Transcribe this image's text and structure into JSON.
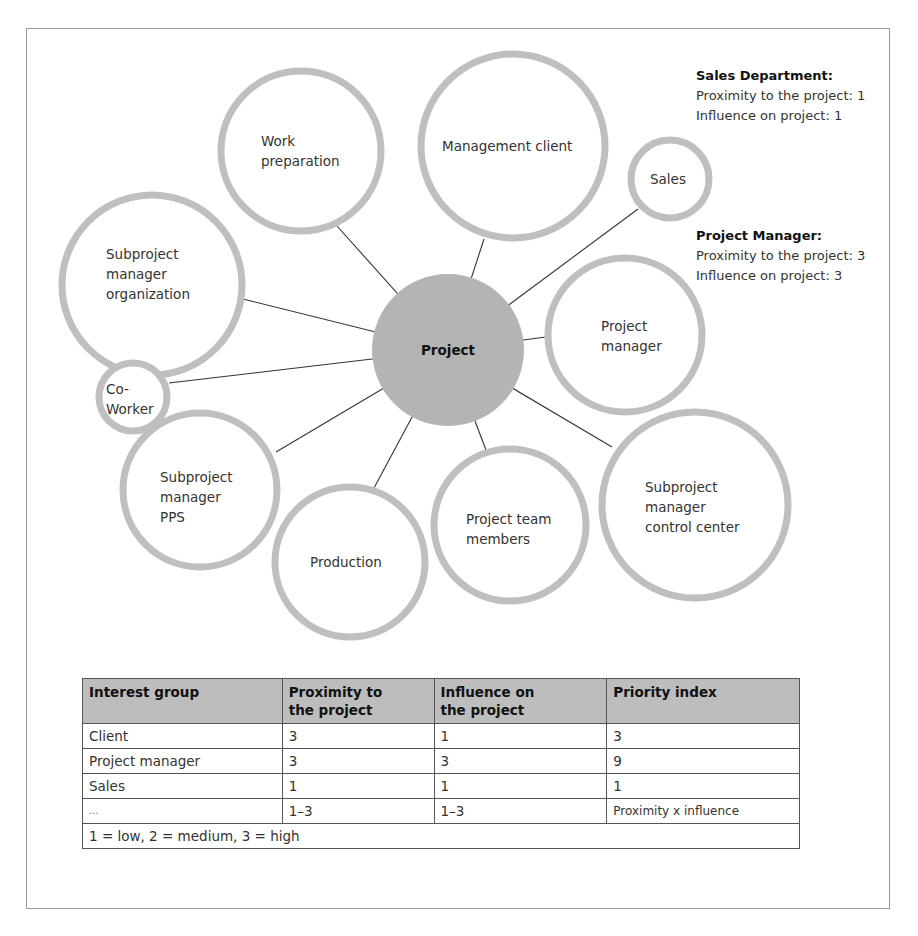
{
  "diagram": {
    "center": {
      "label": "Project",
      "fill": "#b4b4b4"
    },
    "nodes": [
      {
        "id": "work-preparation",
        "label": "Work preparation",
        "lines": [
          "Work",
          "preparation"
        ]
      },
      {
        "id": "management-client",
        "label": "Management client",
        "lines": [
          "Management client"
        ]
      },
      {
        "id": "sales",
        "label": "Sales",
        "lines": [
          "Sales"
        ]
      },
      {
        "id": "subproject-manager-organization",
        "label": "Subproject manager organization",
        "lines": [
          "Subproject",
          "manager",
          "organization"
        ]
      },
      {
        "id": "project-manager",
        "label": "Project manager",
        "lines": [
          "Project",
          "manager"
        ]
      },
      {
        "id": "co-worker",
        "label": "Co-Worker",
        "lines": [
          "Co-",
          "Worker"
        ]
      },
      {
        "id": "subproject-manager-pps",
        "label": "Subproject manager PPS",
        "lines": [
          "Subproject",
          "manager",
          "PPS"
        ]
      },
      {
        "id": "production",
        "label": "Production",
        "lines": [
          "Production"
        ]
      },
      {
        "id": "project-team-members",
        "label": "Project team members",
        "lines": [
          "Project team",
          "members"
        ]
      },
      {
        "id": "subproject-manager-control-center",
        "label": "Subproject manager control center",
        "lines": [
          "Subproject",
          "manager",
          "control center"
        ]
      }
    ],
    "ring_color": "#bfbfbf",
    "connector_color": "#333333"
  },
  "notes": {
    "sales_department": {
      "title": "Sales Department:",
      "proximity": "Proximity to the project: 1",
      "influence": "Influence on project: 1"
    },
    "project_manager": {
      "title": "Project Manager:",
      "proximity": "Proximity to the project: 3",
      "influence": "Influence on project: 3"
    }
  },
  "table": {
    "headers": [
      "Interest group",
      "Proximity to the project",
      "Influence on the project",
      "Priority index"
    ],
    "header_lines": [
      [
        "Interest group"
      ],
      [
        "Proximity to",
        "the project"
      ],
      [
        "Influence on",
        "the project"
      ],
      [
        "Priority index"
      ]
    ],
    "rows": [
      [
        "Client",
        "3",
        "1",
        "3"
      ],
      [
        "Project manager",
        "3",
        "3",
        "9"
      ],
      [
        "Sales",
        "1",
        "1",
        "1"
      ],
      [
        "...",
        "1–3",
        "1–3",
        "Proximity x influence"
      ]
    ],
    "footer": "1 = low, 2 = medium, 3 = high",
    "header_fill": "#bdbdbd"
  }
}
